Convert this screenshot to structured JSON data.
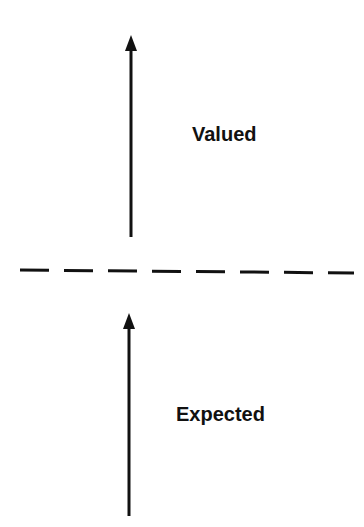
{
  "diagram": {
    "upper_label": "Valued",
    "lower_label": "Expected",
    "colors": {
      "background": "#ffffff",
      "stroke": "#111111"
    },
    "arrows": [
      {
        "name": "upper-arrow",
        "x": 131,
        "tail_y": 237,
        "tip_y": 35
      },
      {
        "name": "lower-arrow",
        "x": 129,
        "tail_y": 516,
        "tip_y": 313
      }
    ],
    "divider": {
      "style": "dashed",
      "y": 271
    }
  }
}
